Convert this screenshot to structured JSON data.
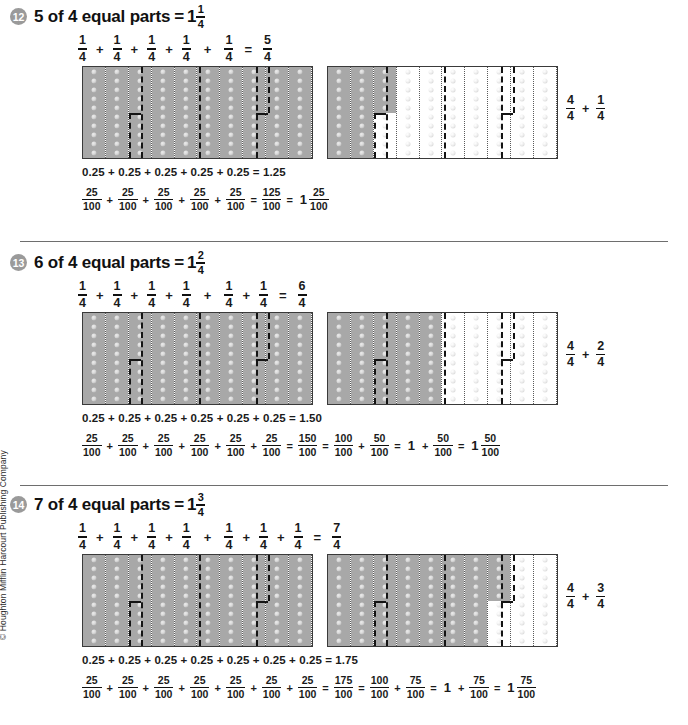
{
  "copyright": "© Houghton Mifflin Harcourt Publishing Company",
  "symbols": {
    "plus": "+",
    "equals": "=",
    "one": "1"
  },
  "problems": [
    {
      "number": "12",
      "title_prefix": "5 of 4 equal parts",
      "title_equals": "=",
      "answer_whole": "1",
      "answer_num": "1",
      "answer_den": "4",
      "quarter_terms": [
        "1/4",
        "1/4",
        "1/4",
        "1/4",
        "1/4"
      ],
      "quarter_num": "1",
      "quarter_den": "4",
      "sum_num": "5",
      "sum_den": "4",
      "left_grid_shaded_cols": 10,
      "left_grid_shaded_partial": 0,
      "right_grid_shaded_cols": 2,
      "right_grid_shaded_partial": 5,
      "right_sum": {
        "a_num": "4",
        "a_den": "4",
        "b_num": "1",
        "b_den": "4"
      },
      "decimal_line": "0.25 + 0.25 + 0.25 + 0.25 + 0.25 = 1.25",
      "hundredth_terms": 5,
      "hundredth_num": "25",
      "hundredth_den": "100",
      "total_num": "125",
      "total_den": "100",
      "show_split": false,
      "whole_num": "100",
      "whole_den": "100",
      "rem_num": "25",
      "rem_den": "100",
      "mixed_whole": "1",
      "mixed_num": "25",
      "mixed_den": "100"
    },
    {
      "number": "13",
      "title_prefix": "6 of 4 equal parts",
      "title_equals": "=",
      "answer_whole": "1",
      "answer_num": "2",
      "answer_den": "4",
      "quarter_terms": [
        "1/4",
        "1/4",
        "1/4",
        "1/4",
        "1/4",
        "1/4"
      ],
      "quarter_num": "1",
      "quarter_den": "4",
      "sum_num": "6",
      "sum_den": "4",
      "left_grid_shaded_cols": 10,
      "left_grid_shaded_partial": 0,
      "right_grid_shaded_cols": 5,
      "right_grid_shaded_partial": 0,
      "right_sum": {
        "a_num": "4",
        "a_den": "4",
        "b_num": "2",
        "b_den": "4"
      },
      "decimal_line": "0.25 + 0.25 + 0.25 + 0.25 + 0.25 + 0.25 = 1.50",
      "hundredth_terms": 6,
      "hundredth_num": "25",
      "hundredth_den": "100",
      "total_num": "150",
      "total_den": "100",
      "show_split": true,
      "whole_num": "100",
      "whole_den": "100",
      "rem_num": "50",
      "rem_den": "100",
      "mixed_whole": "1",
      "mixed_num": "50",
      "mixed_den": "100"
    },
    {
      "number": "14",
      "title_prefix": "7 of 4 equal parts",
      "title_equals": "=",
      "answer_whole": "1",
      "answer_num": "3",
      "answer_den": "4",
      "quarter_terms": [
        "1/4",
        "1/4",
        "1/4",
        "1/4",
        "1/4",
        "1/4",
        "1/4"
      ],
      "quarter_num": "1",
      "quarter_den": "4",
      "sum_num": "7",
      "sum_den": "4",
      "left_grid_shaded_cols": 10,
      "left_grid_shaded_partial": 0,
      "right_grid_shaded_cols": 7,
      "right_grid_shaded_partial": 5,
      "right_sum": {
        "a_num": "4",
        "a_den": "4",
        "b_num": "3",
        "b_den": "4"
      },
      "decimal_line": "0.25 + 0.25 + 0.25 + 0.25 + 0.25 + 0.25 + 0.25 = 1.75",
      "hundredth_terms": 7,
      "hundredth_num": "25",
      "hundredth_den": "100",
      "total_num": "175",
      "total_den": "100",
      "show_split": true,
      "whole_num": "100",
      "whole_den": "100",
      "rem_num": "75",
      "rem_den": "100",
      "mixed_whole": "1",
      "mixed_num": "75",
      "mixed_den": "100"
    }
  ]
}
